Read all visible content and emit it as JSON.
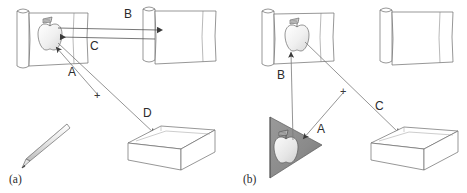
{
  "figure": {
    "background": "#ffffff",
    "stroke_color": "#555555",
    "label_color": "#2b2b2b",
    "wedge_fill": "#8a8a8a",
    "apple_fill": "#f2f2f2",
    "width": 467,
    "height": 193
  },
  "panels": [
    {
      "id": "a",
      "caption": "(a)",
      "objects": [
        {
          "name": "scroll-left-with-apple",
          "label": ""
        },
        {
          "name": "scroll-right-empty",
          "label": ""
        },
        {
          "name": "pencil",
          "label": ""
        },
        {
          "name": "open-box",
          "label": ""
        }
      ],
      "arrows": [
        {
          "key": "B",
          "label": "B",
          "from": "scroll-left",
          "to": "scroll-right",
          "direction": "right"
        },
        {
          "key": "C",
          "label": "C",
          "from": "scroll-right",
          "to": "apple",
          "direction": "left"
        },
        {
          "key": "A",
          "label": "A",
          "from": "pencil-area",
          "to": "apple",
          "direction": "up-left"
        },
        {
          "key": "D",
          "label": "D",
          "from": "apple",
          "to": "open-box",
          "direction": "down-right"
        }
      ],
      "marker": "+"
    },
    {
      "id": "b",
      "caption": "(b)",
      "objects": [
        {
          "name": "scroll-left-with-apple",
          "label": ""
        },
        {
          "name": "scroll-right-empty",
          "label": ""
        },
        {
          "name": "wedge-with-apple",
          "label": ""
        },
        {
          "name": "open-box",
          "label": ""
        }
      ],
      "arrows": [
        {
          "key": "B",
          "label": "B",
          "from": "wedge",
          "to": "scroll-left-apple",
          "direction": "up"
        },
        {
          "key": "A",
          "label": "A",
          "from": "lower-right",
          "to": "wedge-apple",
          "direction": "left"
        },
        {
          "key": "C",
          "label": "C",
          "from": "scroll-left-apple",
          "to": "open-box",
          "direction": "down-right"
        }
      ],
      "marker": "+"
    }
  ],
  "labels": {
    "a_caption": "(a)",
    "b_caption": "(b)",
    "a_A": "A",
    "a_B": "B",
    "a_C": "C",
    "a_D": "D",
    "a_plus": "+",
    "b_A": "A",
    "b_B": "B",
    "b_C": "C",
    "b_plus": "+"
  }
}
